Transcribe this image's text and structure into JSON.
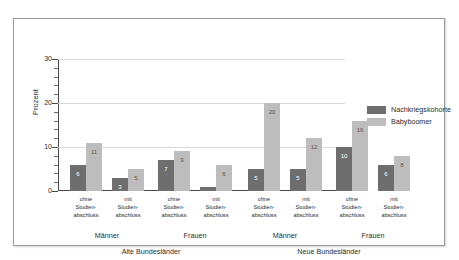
{
  "chart_data": {
    "type": "bar",
    "title": "",
    "xlabel": "",
    "ylabel": "Prozent",
    "ylim": [
      0,
      30
    ],
    "yticks": [
      0,
      10,
      20,
      30
    ],
    "ytick_labels": [
      "0",
      "10",
      "20",
      "30"
    ],
    "minor_tick_step": 2,
    "grid": true,
    "legend_position": "right",
    "categories": [
      "ohne Studien-abschluss",
      "mit Studien-abschluss",
      "ohne Studien-abschluss",
      "mit Studien-abschluss",
      "ohne Studien-abschluss",
      "mit Studien-abschluss",
      "ohne Studien-abschluss",
      "mit Studien-abschluss"
    ],
    "category_lines": [
      [
        "ohne",
        "Studien-",
        "abschluss"
      ],
      [
        "mit",
        "Studien-",
        "abschluss"
      ],
      [
        "ohne",
        "Studien-",
        "abschluss"
      ],
      [
        "mit",
        "Studien-",
        "abschluss"
      ],
      [
        "ohne",
        "Studien-",
        "abschluss"
      ],
      [
        "mit",
        "Studien-",
        "abschluss"
      ],
      [
        "ohne",
        "Studien-",
        "abschluss"
      ],
      [
        "mit",
        "Studien-",
        "abschluss"
      ]
    ],
    "group_labels": [
      "Männer",
      "Frauen",
      "Männer",
      "Frauen"
    ],
    "region_labels": [
      "Alte Bundesländer",
      "Neue Bundesländer"
    ],
    "series": [
      {
        "name": "Nachkriegskohorte",
        "color": "#6e6e6e",
        "values": [
          6,
          3,
          7,
          1,
          5,
          5,
          10,
          6
        ],
        "labels": [
          "6",
          "3",
          "7",
          "",
          "5",
          "5",
          "10",
          "6"
        ]
      },
      {
        "name": "Babyboomer",
        "color": "#bdbdbd",
        "values": [
          11,
          5,
          9,
          6,
          20,
          12,
          16,
          8
        ],
        "labels": [
          "11",
          "5",
          "9",
          "6",
          "20",
          "12",
          "16",
          "8"
        ]
      }
    ]
  }
}
